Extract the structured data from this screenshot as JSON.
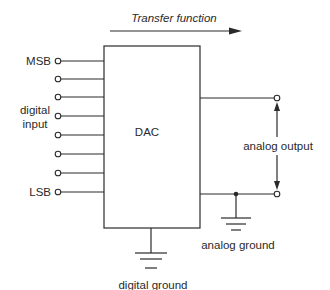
{
  "diagram": {
    "title_arrow_label": "Transfer function",
    "block_label": "DAC",
    "inputs": {
      "msb_label": "MSB",
      "lsb_label": "LSB",
      "group_label_line1": "digital",
      "group_label_line2": "input",
      "count": 8
    },
    "output_label": "analog output",
    "analog_ground_label": "analog ground",
    "digital_ground_label": "digital ground"
  }
}
